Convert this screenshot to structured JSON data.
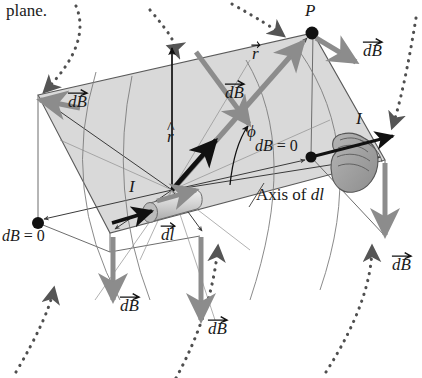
{
  "figure": {
    "domain": "physics-diagram",
    "caption_fragment": "plane.",
    "colors": {
      "plane_fill": "#d8d8d8",
      "plane_edge": "#4a4a4a",
      "vector_gray": "#8c8c8c",
      "vector_black": "#111111",
      "dotted_arc": "#555555",
      "hand_fill": "#9a9a9a",
      "element_fill": "#c9c9c9"
    }
  },
  "labels": {
    "point_p": "P",
    "r_vector": "r",
    "r_hat": "r",
    "phi": "ϕ",
    "current_left": "I",
    "current_right": "I",
    "dl_vector": "dl",
    "axis_of_dl": "Axis of dl",
    "db_zero_left": "dB = 0",
    "db_zero_right": "dB = 0",
    "db_top_right": "dB",
    "db_mid": "dB",
    "db_upper_left": "dB",
    "db_bottom_left": "dB",
    "db_bottom_mid": "dB",
    "db_bottom_right": "dB"
  },
  "vector_labels": {
    "db": "dB",
    "r": "r",
    "dl": "dl"
  },
  "annotations": {
    "db_equals_zero_text": "dB",
    "equals": "=",
    "zero": "0",
    "axis_prefix": "Axis of",
    "axis_suffix": "dl"
  },
  "icons": {
    "hand": "right-hand-grip-icon",
    "current_element": "current-element-cylinder-icon",
    "point_marker": "point-dot-icon",
    "field_line": "dotted-field-line-arc-icon"
  },
  "geometry": {
    "plane_corners": [
      [
        38,
        95
      ],
      [
        313,
        33
      ],
      [
        385,
        160
      ],
      [
        110,
        233
      ]
    ],
    "source_point": [
      172,
      190
    ],
    "field_point_p": [
      312,
      33
    ],
    "zero_dots": [
      [
        38,
        223
      ],
      [
        311,
        157
      ]
    ]
  }
}
